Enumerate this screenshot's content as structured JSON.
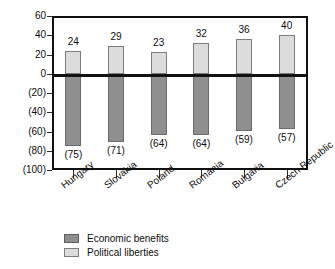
{
  "chart_data": {
    "type": "bar",
    "title": "",
    "subtitle": "",
    "xlabel": "",
    "ylabel": "",
    "orientation": "vertical",
    "grid": false,
    "legend_position": "bottom-left",
    "ylim": [
      -100,
      60
    ],
    "yticks": [
      60,
      40,
      20,
      0,
      -20,
      -40,
      -60,
      -80,
      -100
    ],
    "ytick_labels": [
      "60",
      "40",
      "20",
      "0",
      "(20)",
      "(40)",
      "(60)",
      "(80)",
      "(100)"
    ],
    "categories": [
      "Hungary",
      "Slovakia",
      "Poland",
      "Romania",
      "Bulgaria",
      "Czech Republic"
    ],
    "series": [
      {
        "name": "Economic benefits",
        "color": "#8f8f8f",
        "values": [
          -75,
          -71,
          -64,
          -64,
          -59,
          -57
        ],
        "data_labels": [
          "(75)",
          "(71)",
          "(64)",
          "(64)",
          "(59)",
          "(57)"
        ]
      },
      {
        "name": "Political liberties",
        "color": "#dcdcdc",
        "values": [
          24,
          29,
          23,
          32,
          36,
          40
        ],
        "data_labels": [
          "24",
          "29",
          "23",
          "32",
          "36",
          "40"
        ]
      }
    ]
  },
  "legend": {
    "items": [
      {
        "label": "Economic benefits",
        "swatch": "dark"
      },
      {
        "label": "Political liberties",
        "swatch": "light"
      }
    ]
  }
}
